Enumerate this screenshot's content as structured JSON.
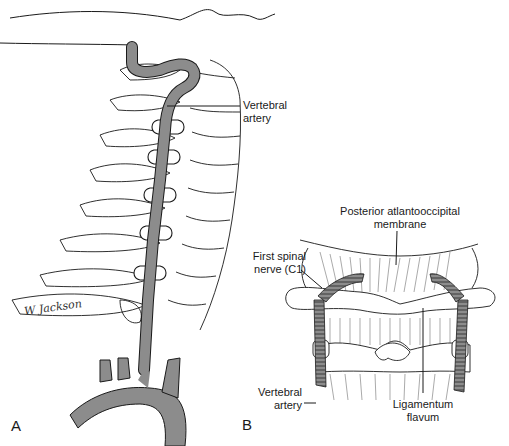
{
  "figure": {
    "panels": [
      {
        "id": "A",
        "letter": "A",
        "description": "Lateral view of cervical spine showing the vertebral artery ascending through transverse foramina from the aortic arch branches",
        "labels": [
          {
            "text_line1": "Vertebral",
            "text_line2": "artery"
          }
        ],
        "signature": "W Jackson"
      },
      {
        "id": "B",
        "letter": "B",
        "description": "Posterior view of upper cervical region with atlas, membranes and vertebral arteries",
        "labels": [
          {
            "text_line1": "Posterior atlantooccipital",
            "text_line2": "membrane"
          },
          {
            "text_line1": "First spinal",
            "text_line2": "nerve (C1)"
          },
          {
            "text_line1": "Vertebral",
            "text_line2": "artery"
          },
          {
            "text_line1": "Ligamentum",
            "text_line2": "flavum"
          }
        ]
      }
    ],
    "colors": {
      "artery_fill": "#8c8c8c",
      "outline": "#1a1a1a",
      "background": "#ffffff"
    }
  }
}
